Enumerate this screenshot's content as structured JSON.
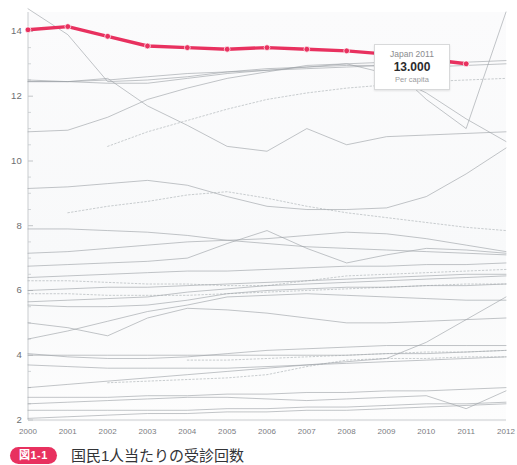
{
  "figure": {
    "caption_badge": "図1-1",
    "caption_text": "国民1人当たりの受診回数"
  },
  "tooltip": {
    "title": "Japan 2011",
    "value": "13.000",
    "subtitle": "Per capita",
    "accent_color": "#e8315f"
  },
  "chart_data": {
    "type": "line",
    "title": "",
    "subtitle": "",
    "xlabel": "",
    "ylabel": "",
    "x": [
      2000,
      2001,
      2002,
      2003,
      2004,
      2005,
      2006,
      2007,
      2008,
      2009,
      2010,
      2011,
      2012
    ],
    "tick_labels_x": [
      "2000",
      "2001",
      "2002",
      "2003",
      "2004",
      "2005",
      "2006",
      "2007",
      "2008",
      "2009",
      "2010",
      "2011",
      "2012"
    ],
    "tick_labels_y": [
      "2",
      "4",
      "6",
      "8",
      "10",
      "12",
      "14"
    ],
    "xlim": [
      2000,
      2012
    ],
    "ylim": [
      2,
      14.6
    ],
    "grid": false,
    "legend": "none",
    "highlight_series": "Japan",
    "highlight_color": "#e8315f",
    "background_series_color": "#9aa0a4",
    "annotation": "Japan 2011 = 13.000 per capita",
    "series": [
      {
        "name": "Japan",
        "style": "solid-marker",
        "color": "#e8315f",
        "values": [
          14.05,
          14.15,
          13.85,
          13.55,
          13.5,
          13.45,
          13.5,
          13.45,
          13.4,
          13.3,
          13.15,
          13.0,
          null
        ]
      },
      {
        "name": "Country A",
        "style": "solid",
        "color": "#9aa0a4",
        "values": [
          14.7,
          13.9,
          12.45,
          12.5,
          12.6,
          12.75,
          12.85,
          12.9,
          12.95,
          12.95,
          12.9,
          12.95,
          13.0
        ]
      },
      {
        "name": "Country B",
        "style": "solid",
        "color": "#9aa0a4",
        "values": [
          12.45,
          12.45,
          12.5,
          12.6,
          12.7,
          12.75,
          12.8,
          12.85,
          12.9,
          12.95,
          13.0,
          13.05,
          13.1
        ]
      },
      {
        "name": "Country C",
        "style": "solid",
        "color": "#9aa0a4",
        "values": [
          10.9,
          10.95,
          11.35,
          11.9,
          12.25,
          12.55,
          12.75,
          12.95,
          13.0,
          12.7,
          12.1,
          11.3,
          10.6
        ]
      },
      {
        "name": "Country D",
        "style": "solid",
        "color": "#9aa0a4",
        "values": [
          12.5,
          12.45,
          12.4,
          12.4,
          12.55,
          12.7,
          12.8,
          12.9,
          13.0,
          13.05,
          11.9,
          11.0,
          14.6
        ]
      },
      {
        "name": "Country E",
        "style": "solid",
        "color": "#9aa0a4",
        "values": [
          12.45,
          12.45,
          12.55,
          11.7,
          11.1,
          10.45,
          10.3,
          11.0,
          10.5,
          10.75,
          10.8,
          10.85,
          10.9
        ]
      },
      {
        "name": "Country F",
        "style": "dotted",
        "color": "#a8aeb2",
        "values": [
          null,
          null,
          10.45,
          10.9,
          11.25,
          11.6,
          11.9,
          12.1,
          12.25,
          12.35,
          12.45,
          12.5,
          12.55
        ]
      },
      {
        "name": "Country G",
        "style": "solid",
        "color": "#9aa0a4",
        "values": [
          9.15,
          9.2,
          9.3,
          9.4,
          9.25,
          8.9,
          8.6,
          8.5,
          8.5,
          8.55,
          8.9,
          9.6,
          10.4
        ]
      },
      {
        "name": "Country H",
        "style": "dotted",
        "color": "#a8aeb2",
        "values": [
          null,
          8.4,
          8.6,
          8.75,
          8.95,
          9.05,
          8.85,
          8.6,
          8.4,
          8.25,
          8.1,
          7.95,
          7.85
        ]
      },
      {
        "name": "Country I",
        "style": "solid",
        "color": "#9aa0a4",
        "values": [
          7.9,
          7.9,
          7.85,
          7.8,
          7.7,
          7.55,
          7.45,
          7.35,
          7.3,
          7.25,
          7.2,
          7.15,
          7.1
        ]
      },
      {
        "name": "Country J",
        "style": "solid",
        "color": "#9aa0a4",
        "values": [
          7.15,
          7.2,
          7.3,
          7.4,
          7.5,
          7.55,
          7.6,
          7.7,
          7.8,
          7.75,
          7.6,
          7.4,
          7.2
        ]
      },
      {
        "name": "Country K",
        "style": "solid",
        "color": "#9aa0a4",
        "values": [
          6.75,
          6.8,
          6.85,
          6.9,
          7.0,
          7.45,
          7.85,
          7.3,
          6.85,
          7.1,
          7.3,
          7.25,
          7.15
        ]
      },
      {
        "name": "Country L",
        "style": "solid",
        "color": "#9aa0a4",
        "values": [
          6.4,
          6.45,
          6.5,
          6.55,
          6.6,
          6.6,
          6.65,
          6.7,
          6.75,
          6.75,
          6.8,
          6.8,
          6.85
        ]
      },
      {
        "name": "Country M",
        "style": "dotted",
        "color": "#a8aeb2",
        "values": [
          6.3,
          6.3,
          6.25,
          6.2,
          6.2,
          6.15,
          6.15,
          6.3,
          6.45,
          6.5,
          6.55,
          6.6,
          6.65
        ]
      },
      {
        "name": "Country N",
        "style": "solid",
        "color": "#9aa0a4",
        "values": [
          6.0,
          6.05,
          6.1,
          6.1,
          6.15,
          6.2,
          6.25,
          6.3,
          6.35,
          6.4,
          6.45,
          6.5,
          6.5
        ]
      },
      {
        "name": "Country O",
        "style": "dotted",
        "color": "#a8aeb2",
        "values": [
          5.9,
          5.9,
          5.85,
          5.85,
          5.85,
          5.9,
          5.95,
          6.0,
          6.05,
          6.1,
          6.15,
          6.2,
          6.2
        ]
      },
      {
        "name": "Country P",
        "style": "solid",
        "color": "#9aa0a4",
        "values": [
          5.65,
          5.7,
          5.75,
          5.8,
          5.95,
          6.05,
          6.15,
          6.2,
          6.25,
          6.3,
          6.35,
          6.4,
          6.45
        ]
      },
      {
        "name": "Country Q",
        "style": "solid",
        "color": "#9aa0a4",
        "values": [
          5.55,
          5.5,
          5.5,
          5.55,
          5.7,
          5.9,
          6.0,
          6.05,
          6.1,
          6.1,
          6.15,
          6.15,
          6.2
        ]
      },
      {
        "name": "Country R",
        "style": "solid",
        "color": "#9aa0a4",
        "values": [
          4.5,
          4.75,
          5.05,
          5.35,
          5.55,
          5.8,
          5.85,
          5.9,
          5.85,
          5.8,
          5.75,
          5.7,
          5.7
        ]
      },
      {
        "name": "Country S",
        "style": "solid",
        "color": "#9aa0a4",
        "values": [
          5.0,
          4.85,
          4.6,
          5.15,
          5.45,
          5.4,
          5.3,
          5.15,
          5.0,
          5.0,
          5.05,
          5.1,
          5.15
        ]
      },
      {
        "name": "Country T",
        "style": "solid",
        "color": "#9aa0a4",
        "values": [
          4.0,
          4.0,
          4.0,
          4.0,
          4.0,
          4.0,
          4.0,
          4.0,
          4.0,
          4.05,
          4.05,
          4.1,
          4.15
        ]
      },
      {
        "name": "Country U",
        "style": "solid",
        "color": "#9aa0a4",
        "values": [
          4.05,
          3.95,
          3.9,
          3.9,
          3.95,
          4.05,
          4.15,
          4.2,
          4.25,
          4.3,
          4.3,
          4.3,
          4.3
        ]
      },
      {
        "name": "Country V",
        "style": "dotted",
        "color": "#a8aeb2",
        "values": [
          null,
          null,
          null,
          null,
          3.85,
          3.85,
          3.9,
          3.95,
          4.0,
          4.05,
          4.1,
          4.1,
          4.15
        ]
      },
      {
        "name": "Country W",
        "style": "solid",
        "color": "#9aa0a4",
        "values": [
          3.7,
          3.65,
          3.6,
          3.6,
          3.6,
          3.6,
          3.65,
          3.7,
          3.75,
          3.8,
          3.85,
          3.9,
          3.95
        ]
      },
      {
        "name": "Country X",
        "style": "dotted",
        "color": "#a8aeb2",
        "values": [
          null,
          null,
          3.15,
          3.2,
          3.25,
          3.3,
          3.4,
          3.65,
          3.85,
          3.9,
          3.9,
          3.95,
          3.95
        ]
      },
      {
        "name": "Country Y",
        "style": "solid",
        "color": "#9aa0a4",
        "values": [
          3.0,
          3.1,
          3.2,
          3.3,
          3.4,
          3.5,
          3.6,
          3.7,
          3.8,
          3.9,
          4.4,
          5.1,
          5.8
        ]
      },
      {
        "name": "Country Z",
        "style": "solid",
        "color": "#9aa0a4",
        "values": [
          2.7,
          2.7,
          2.7,
          2.75,
          2.75,
          2.8,
          2.8,
          2.85,
          2.85,
          2.9,
          2.9,
          2.95,
          3.0
        ]
      },
      {
        "name": "Country AA",
        "style": "solid",
        "color": "#9aa0a4",
        "values": [
          2.5,
          2.55,
          2.6,
          2.65,
          2.7,
          2.7,
          2.65,
          2.6,
          2.65,
          2.7,
          2.75,
          2.35,
          2.9
        ]
      },
      {
        "name": "Country AB",
        "style": "solid",
        "color": "#9aa0a4",
        "values": [
          2.3,
          2.3,
          2.3,
          2.3,
          2.3,
          2.35,
          2.35,
          2.4,
          2.4,
          2.45,
          2.5,
          2.5,
          2.55
        ]
      },
      {
        "name": "Country AC",
        "style": "solid",
        "color": "#9aa0a4",
        "values": [
          2.05,
          2.1,
          2.15,
          2.2,
          2.2,
          2.25,
          2.25,
          2.3,
          2.3,
          2.35,
          2.4,
          2.45,
          2.5
        ]
      }
    ]
  }
}
